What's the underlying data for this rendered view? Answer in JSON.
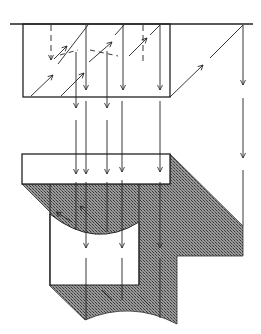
{
  "diagram": {
    "type": "optical/light-path schematic",
    "colors": {
      "line": "#222222",
      "hatch_dark": "#555555",
      "hatch_light": "#9a9a9a",
      "background": "#ffffff"
    },
    "elements": [
      {
        "name": "top-surface-line"
      },
      {
        "name": "upper-block"
      },
      {
        "name": "lower-slab"
      },
      {
        "name": "shaded-cross-section"
      },
      {
        "name": "inner-cavity"
      }
    ],
    "labels": []
  }
}
